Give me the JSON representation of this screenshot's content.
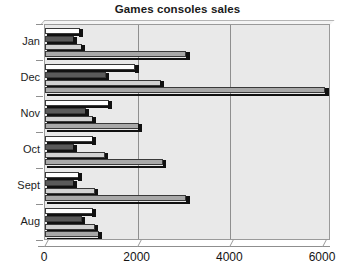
{
  "chart_data": {
    "type": "bar",
    "orientation": "horizontal",
    "title": "Games consoles sales",
    "xlabel": "",
    "ylabel": "",
    "xlim": [
      0,
      6000
    ],
    "xticks": [
      0,
      2000,
      4000,
      6000
    ],
    "xtick_labels": [
      "0",
      "2000",
      "4000",
      "6000"
    ],
    "grid": true,
    "grid_axis": "x",
    "legend": false,
    "legend_position": "none",
    "categories": [
      "Jan",
      "Dec",
      "Nov",
      "Oct",
      "Sept",
      "Aug"
    ],
    "series": [
      {
        "name": "Series 1",
        "color": "#ffffff",
        "values": [
          750,
          1950,
          1380,
          1030,
          730,
          1030
        ]
      },
      {
        "name": "Series 2",
        "color": "#5a5a5a",
        "values": [
          620,
          1320,
          880,
          620,
          620,
          800
        ]
      },
      {
        "name": "Series 3",
        "color": "#d2d2d2",
        "values": [
          790,
          2500,
          1030,
          1300,
          1080,
          1080
        ]
      },
      {
        "name": "Series 4",
        "color": "#a8a8a8",
        "values": [
          3050,
          6050,
          2020,
          2550,
          3050,
          1160
        ]
      }
    ]
  },
  "axis": {
    "category_labels": [
      "Jan",
      "Dec",
      "Nov",
      "Oct",
      "Sept",
      "Aug"
    ],
    "value_labels": [
      "0",
      "2000",
      "4000",
      "6000"
    ]
  }
}
